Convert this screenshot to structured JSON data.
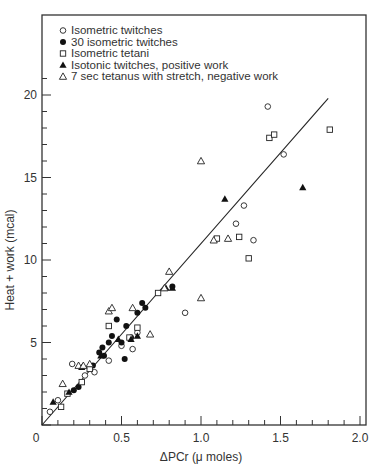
{
  "chart_data": {
    "type": "scatter",
    "title": "",
    "xlabel": "ΔPCr (μ moles)",
    "ylabel": "Heat + work  (mcal)",
    "xlim": [
      0,
      2.0
    ],
    "ylim": [
      0,
      20
    ],
    "x_ticks": [
      "0",
      "0.5",
      "1.0",
      "1.5",
      "2.0"
    ],
    "y_ticks": [
      "5",
      "10",
      "15",
      "20"
    ],
    "grid": false,
    "legend_position": "upper-left",
    "legend": [
      {
        "marker": "open-circle",
        "label": "Isometric twitches"
      },
      {
        "marker": "filled-circle",
        "label": "30 isometric twitches"
      },
      {
        "marker": "open-square",
        "label": "Isometric tetani"
      },
      {
        "marker": "filled-triangle",
        "label": "Isotonic twitches, positive work"
      },
      {
        "marker": "open-triangle",
        "label": "7 sec  tetanus with stretch, negative work"
      }
    ],
    "regression_line": {
      "x": [
        0,
        1.8
      ],
      "y": [
        0,
        19.8
      ]
    },
    "series": [
      {
        "name": "Isometric twitches",
        "marker": "open-circle",
        "points": [
          [
            0.05,
            0.8
          ],
          [
            0.1,
            1.5
          ],
          [
            0.19,
            3.7
          ],
          [
            0.27,
            3.0
          ],
          [
            0.33,
            3.2
          ],
          [
            0.42,
            3.9
          ],
          [
            0.5,
            4.8
          ],
          [
            0.57,
            4.6
          ],
          [
            0.6,
            5.6
          ],
          [
            0.9,
            6.8
          ],
          [
            1.22,
            12.2
          ],
          [
            1.27,
            13.3
          ],
          [
            1.33,
            11.2
          ],
          [
            1.52,
            16.4
          ],
          [
            1.42,
            19.3
          ]
        ]
      },
      {
        "name": "30 isometric twitches",
        "marker": "filled-circle",
        "points": [
          [
            0.2,
            2.1
          ],
          [
            0.23,
            2.3
          ],
          [
            0.32,
            3.6
          ],
          [
            0.36,
            4.4
          ],
          [
            0.38,
            4.7
          ],
          [
            0.39,
            4.2
          ],
          [
            0.42,
            5.0
          ],
          [
            0.44,
            5.4
          ],
          [
            0.47,
            6.4
          ],
          [
            0.5,
            5.0
          ],
          [
            0.52,
            4.0
          ],
          [
            0.53,
            6.0
          ],
          [
            0.56,
            5.3
          ],
          [
            0.6,
            6.8
          ],
          [
            0.63,
            7.4
          ],
          [
            0.65,
            7.1
          ],
          [
            0.82,
            8.4
          ]
        ]
      },
      {
        "name": "Isometric tetani",
        "marker": "open-square",
        "points": [
          [
            0.12,
            1.1
          ],
          [
            0.16,
            1.9
          ],
          [
            0.25,
            2.6
          ],
          [
            0.3,
            3.4
          ],
          [
            0.42,
            6.0
          ],
          [
            0.55,
            5.3
          ],
          [
            0.6,
            5.9
          ],
          [
            0.73,
            8.0
          ],
          [
            1.1,
            11.3
          ],
          [
            1.24,
            11.4
          ],
          [
            1.3,
            10.1
          ],
          [
            1.43,
            17.4
          ],
          [
            1.46,
            17.6
          ],
          [
            1.81,
            17.9
          ]
        ]
      },
      {
        "name": "Isotonic twitches, positive work",
        "marker": "filled-triangle",
        "points": [
          [
            0.07,
            1.4
          ],
          [
            0.17,
            2.0
          ],
          [
            0.25,
            3.5
          ],
          [
            0.37,
            4.2
          ],
          [
            0.48,
            5.2
          ],
          [
            0.56,
            5.2
          ],
          [
            0.6,
            5.4
          ],
          [
            0.78,
            8.3
          ],
          [
            0.82,
            8.3
          ],
          [
            1.15,
            13.7
          ],
          [
            1.64,
            14.4
          ]
        ]
      },
      {
        "name": "7 sec tetanus with stretch, negative work",
        "marker": "open-triangle",
        "points": [
          [
            0.13,
            2.5
          ],
          [
            0.23,
            3.6
          ],
          [
            0.26,
            3.6
          ],
          [
            0.3,
            3.7
          ],
          [
            0.42,
            6.9
          ],
          [
            0.44,
            7.1
          ],
          [
            0.57,
            7.1
          ],
          [
            0.68,
            5.5
          ],
          [
            0.77,
            8.3
          ],
          [
            0.8,
            9.3
          ],
          [
            1.0,
            16.0
          ],
          [
            1.0,
            7.7
          ],
          [
            1.08,
            11.2
          ],
          [
            1.17,
            11.3
          ]
        ]
      }
    ]
  }
}
